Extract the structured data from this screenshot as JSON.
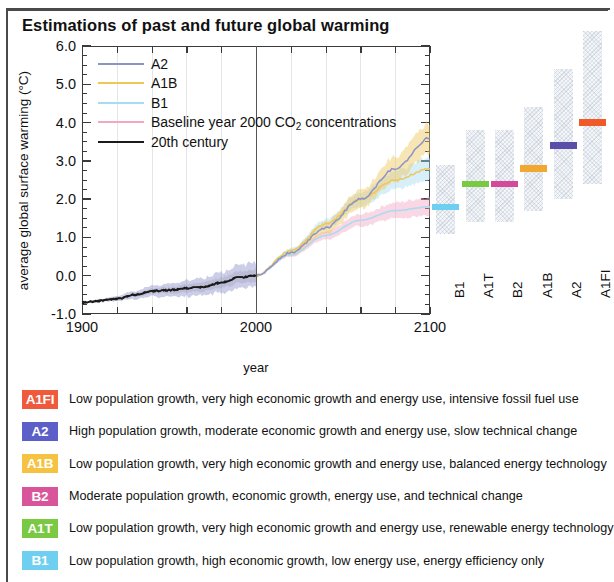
{
  "title": "Estimations of past and future global warming",
  "chart_data": {
    "type": "line",
    "title": "Estimations of past and future global warming",
    "xlabel": "year",
    "ylabel": "average global surface warming (°C)",
    "xlim": [
      1900,
      2100
    ],
    "ylim": [
      -1.0,
      6.0
    ],
    "xticks": [
      1900,
      2000,
      2100
    ],
    "xtick_labels": [
      "1900",
      "2000",
      "2100"
    ],
    "yticks": [
      -1.0,
      0.0,
      1.0,
      2.0,
      3.0,
      4.0,
      5.0,
      6.0
    ],
    "ytick_labels": [
      "-1.0",
      "0.0",
      "1.0",
      "2.0",
      "3.0",
      "4.0",
      "5.0",
      "6.0"
    ],
    "grid": true,
    "legend_position": "upper left",
    "annotation_divider_year": 2000,
    "legend": [
      {
        "label": "A2",
        "color": "#8c93c8"
      },
      {
        "label": "A1B",
        "color": "#f0c659"
      },
      {
        "label": "B1",
        "color": "#a7dcf0"
      },
      {
        "label": "Baseline year 2000 CO2 concentrations",
        "color": "#f2a7c3"
      },
      {
        "label": "20th century",
        "color": "#1a1a1a"
      }
    ],
    "series": [
      {
        "name": "20th century",
        "color": "#1a1a1a",
        "x": [
          1900,
          1910,
          1920,
          1930,
          1940,
          1950,
          1960,
          1970,
          1980,
          1990,
          2000
        ],
        "values": [
          -0.7,
          -0.66,
          -0.6,
          -0.5,
          -0.4,
          -0.38,
          -0.33,
          -0.3,
          -0.18,
          -0.05,
          0.0
        ]
      },
      {
        "name": "A2",
        "color": "#8c93c8",
        "x": [
          2000,
          2020,
          2040,
          2060,
          2080,
          2100
        ],
        "values": [
          0.0,
          0.6,
          1.25,
          2.0,
          2.8,
          3.6
        ]
      },
      {
        "name": "A1B",
        "color": "#f0c659",
        "x": [
          2000,
          2020,
          2040,
          2060,
          2080,
          2100
        ],
        "values": [
          0.0,
          0.65,
          1.35,
          2.0,
          2.5,
          2.8
        ]
      },
      {
        "name": "B1",
        "color": "#a7dcf0",
        "x": [
          2000,
          2020,
          2040,
          2060,
          2080,
          2100
        ],
        "values": [
          0.0,
          0.55,
          1.05,
          1.45,
          1.7,
          1.8
        ]
      },
      {
        "name": "Baseline year 2000 CO2 concentrations",
        "color": "#f2a7c3",
        "x": [
          2000,
          2020,
          2040,
          2060,
          2080,
          2100
        ],
        "values": [
          0.0,
          0.35,
          0.48,
          0.55,
          0.58,
          0.6
        ]
      }
    ],
    "bar_panel": {
      "ylabel_shared": true,
      "bars": [
        {
          "label": "B1",
          "low": 1.1,
          "high": 2.9,
          "best": 1.8,
          "color": "#6ecff0"
        },
        {
          "label": "A1T",
          "low": 1.4,
          "high": 3.8,
          "best": 2.4,
          "color": "#7ac943"
        },
        {
          "label": "B2",
          "low": 1.4,
          "high": 3.8,
          "best": 2.4,
          "color": "#d44a9a"
        },
        {
          "label": "A1B",
          "low": 1.7,
          "high": 4.4,
          "best": 2.8,
          "color": "#f0a830"
        },
        {
          "label": "A2",
          "low": 2.0,
          "high": 5.4,
          "best": 3.4,
          "color": "#5b4ea8"
        },
        {
          "label": "A1FI",
          "low": 2.4,
          "high": 6.4,
          "best": 4.0,
          "color": "#f05a28"
        }
      ]
    }
  },
  "scenarios": [
    {
      "code": "A1FI",
      "color": "#f05a3c",
      "description": "Low population growth, very high economic growth and energy use, intensive fossil fuel use"
    },
    {
      "code": "A2",
      "color": "#5b5fc7",
      "description": "High population growth, moderate economic growth and energy use, slow technical change"
    },
    {
      "code": "A1B",
      "color": "#f5c242",
      "description": "Low population growth, very high economic growth and energy use, balanced energy technology"
    },
    {
      "code": "B2",
      "color": "#d9559b",
      "description": "Moderate population growth, economic growth, energy use, and technical change"
    },
    {
      "code": "A1T",
      "color": "#7ac943",
      "description": "Low population growth, very high economic growth and energy use, renewable energy technology"
    },
    {
      "code": "B1",
      "color": "#6ecff0",
      "description": "Low population growth, high economic growth, low energy use, energy efficiency only"
    }
  ]
}
